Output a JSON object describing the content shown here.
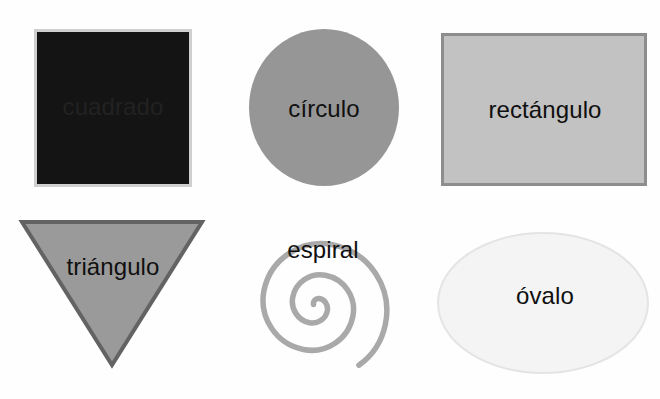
{
  "page": {
    "background_color": "#fefefe",
    "width": 660,
    "height": 399,
    "language": "es"
  },
  "shapes": [
    {
      "id": "square",
      "icon": "square-icon",
      "label": "cuadrado",
      "fill": "#141414",
      "stroke": "#cfcfcf",
      "label_color": "#2b2b2b",
      "note": "texto oscuro sobre fondo oscuro, apenas visible"
    },
    {
      "id": "circle",
      "icon": "circle-icon",
      "label": "círculo",
      "fill": "#969696",
      "stroke": "none",
      "label_color": "#101010"
    },
    {
      "id": "rectangle",
      "icon": "rectangle-icon",
      "label": "rectángulo",
      "fill": "#c2c2c2",
      "stroke": "#8d8d8d",
      "label_color": "#0f0f0f"
    },
    {
      "id": "triangle",
      "icon": "triangle-down-icon",
      "label": "triángulo",
      "fill": "#9a9a9a",
      "stroke": "#636363",
      "label_color": "#101010"
    },
    {
      "id": "spiral",
      "icon": "spiral-icon",
      "label": "espiral",
      "fill": "none",
      "stroke": "#a9a9a9",
      "label_color": "#101010"
    },
    {
      "id": "oval",
      "icon": "ellipse-icon",
      "label": "óvalo",
      "fill": "#f4f4f4",
      "stroke": "#e4e4e4",
      "label_color": "#101010"
    }
  ]
}
